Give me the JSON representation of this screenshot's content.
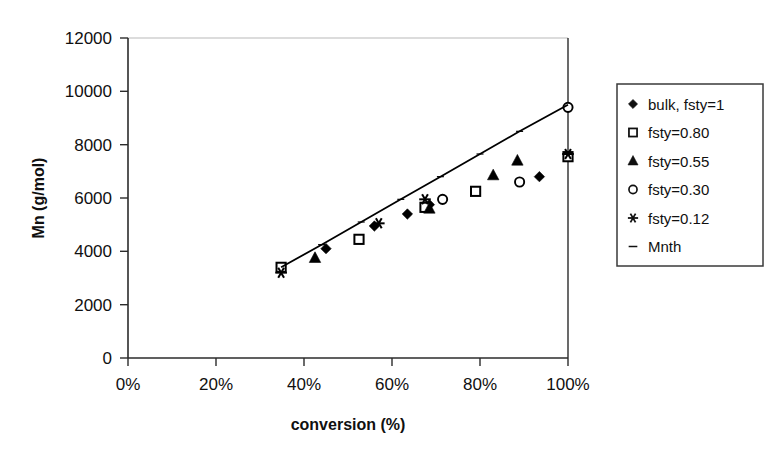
{
  "chart_data": {
    "type": "scatter",
    "title": "",
    "xlabel": "conversion (%)",
    "ylabel": "Mn (g/mol)",
    "xlim": [
      0,
      100
    ],
    "ylim": [
      0,
      12000
    ],
    "xticks": [
      "0%",
      "20%",
      "40%",
      "60%",
      "80%",
      "100%"
    ],
    "xtick_values": [
      0,
      20,
      40,
      60,
      80,
      100
    ],
    "yticks": [
      "0",
      "2000",
      "4000",
      "6000",
      "8000",
      "10000",
      "12000"
    ],
    "ytick_values": [
      0,
      2000,
      4000,
      6000,
      8000,
      10000,
      12000
    ],
    "grid": false,
    "legend_position": "right",
    "series": [
      {
        "name": "bulk, fsty=1",
        "marker": "filled-diamond",
        "color": "#000000",
        "points": [
          {
            "x": 45.0,
            "y": 4100
          },
          {
            "x": 56.0,
            "y": 4950
          },
          {
            "x": 63.5,
            "y": 5400
          },
          {
            "x": 68.5,
            "y": 5750
          },
          {
            "x": 93.5,
            "y": 6800
          }
        ]
      },
      {
        "name": "fsty=0.80",
        "marker": "open-square",
        "color": "#000000",
        "points": [
          {
            "x": 34.8,
            "y": 3400
          },
          {
            "x": 52.5,
            "y": 4450
          },
          {
            "x": 67.5,
            "y": 5650
          },
          {
            "x": 79.0,
            "y": 6250
          },
          {
            "x": 100.0,
            "y": 7550
          }
        ]
      },
      {
        "name": "fsty=0.55",
        "marker": "filled-triangle",
        "color": "#000000",
        "points": [
          {
            "x": 42.5,
            "y": 3750
          },
          {
            "x": 68.5,
            "y": 5600
          },
          {
            "x": 83.0,
            "y": 6850
          },
          {
            "x": 88.5,
            "y": 7400
          }
        ]
      },
      {
        "name": "fsty=0.30",
        "marker": "open-circle",
        "color": "#000000",
        "points": [
          {
            "x": 71.5,
            "y": 5950
          },
          {
            "x": 89.0,
            "y": 6600
          },
          {
            "x": 100.0,
            "y": 9400
          }
        ]
      },
      {
        "name": "fsty=0.12",
        "marker": "star",
        "color": "#000000",
        "points": [
          {
            "x": 34.8,
            "y": 3200
          },
          {
            "x": 57.0,
            "y": 5050
          },
          {
            "x": 67.5,
            "y": 5950
          },
          {
            "x": 100.0,
            "y": 7650
          }
        ]
      },
      {
        "name": "Mnth",
        "marker": "dash-line",
        "color": "#000000",
        "points": [
          {
            "x": 34.8,
            "y": 3400
          },
          {
            "x": 44.0,
            "y": 4250
          },
          {
            "x": 53.0,
            "y": 5100
          },
          {
            "x": 62.0,
            "y": 5950
          },
          {
            "x": 71.0,
            "y": 6800
          },
          {
            "x": 80.0,
            "y": 7650
          },
          {
            "x": 89.0,
            "y": 8500
          },
          {
            "x": 100.0,
            "y": 9500
          }
        ]
      }
    ]
  },
  "legend": {
    "entries": [
      {
        "label": "bulk, fsty=1",
        "marker": "filled-diamond"
      },
      {
        "label": "fsty=0.80",
        "marker": "open-square"
      },
      {
        "label": "fsty=0.55",
        "marker": "filled-triangle"
      },
      {
        "label": "fsty=0.30",
        "marker": "open-circle"
      },
      {
        "label": "fsty=0.12",
        "marker": "star"
      },
      {
        "label": "Mnth",
        "marker": "dash-line"
      }
    ]
  },
  "axes": {
    "x_title": "conversion (%)",
    "y_title": "Mn (g/mol)",
    "x_tick_0": "0%",
    "x_tick_1": "20%",
    "x_tick_2": "40%",
    "x_tick_3": "60%",
    "x_tick_4": "80%",
    "x_tick_5": "100%",
    "y_tick_0": "0",
    "y_tick_1": "2000",
    "y_tick_2": "4000",
    "y_tick_3": "6000",
    "y_tick_4": "8000",
    "y_tick_5": "10000",
    "y_tick_6": "12000"
  },
  "colors": {
    "ink": "#101010",
    "frame": "#333333",
    "gridline": "#b8b8b8",
    "background": "#ffffff"
  }
}
